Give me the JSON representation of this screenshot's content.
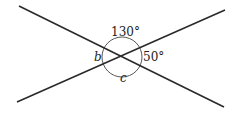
{
  "diagram": {
    "type": "intersecting-lines-angles",
    "angles": {
      "top": "130°",
      "right": "50°",
      "left": "b",
      "bottom": "c"
    },
    "colors": {
      "line": "#2a2a2a",
      "background": "#ffffff"
    }
  }
}
